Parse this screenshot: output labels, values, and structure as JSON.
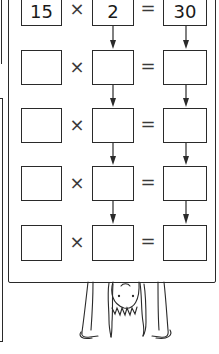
{
  "worksheet": {
    "operators": {
      "times": "×",
      "equals": "="
    },
    "rows": [
      {
        "a": "15",
        "b": "2",
        "c": "30"
      },
      {
        "a": "",
        "b": "",
        "c": ""
      },
      {
        "a": "",
        "b": "",
        "c": ""
      },
      {
        "a": "",
        "b": "",
        "c": ""
      },
      {
        "a": "",
        "b": "",
        "c": ""
      }
    ],
    "arrow_direction": "down",
    "illustration": "upside-down-child-holding-board"
  },
  "colors": {
    "ink": "#2a2a2a",
    "background": "#ffffff"
  }
}
